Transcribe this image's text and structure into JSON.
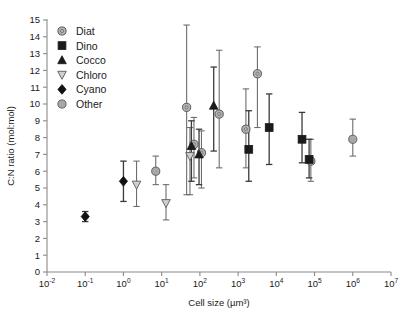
{
  "chart_data": {
    "type": "scatter",
    "title": "",
    "xlabel": "Cell size (µm³)",
    "ylabel": "C:N ratio (mol:mol)",
    "xscale": "log",
    "xlim": [
      0.01,
      10000000
    ],
    "ylim": [
      0,
      15
    ],
    "yticks": [
      0,
      1,
      2,
      3,
      4,
      5,
      6,
      7,
      8,
      9,
      10,
      11,
      12,
      13,
      14,
      15
    ],
    "xtick_labels": [
      "10-2",
      "10-1",
      "100",
      "101",
      "102",
      "103",
      "104",
      "105",
      "106",
      "107"
    ],
    "xtick_mantissa": "10",
    "xtick_exponents": [
      "-2",
      "-1",
      "0",
      "1",
      "2",
      "3",
      "4",
      "5",
      "6",
      "7"
    ],
    "grid": false,
    "legend_position": "top-left",
    "legend": [
      {
        "name": "Diat",
        "marker": "circle-ring",
        "color": "#b3b3b3",
        "edge": "#4d4d4d"
      },
      {
        "name": "Dino",
        "marker": "square",
        "color": "#1a1a1a",
        "edge": "#1a1a1a"
      },
      {
        "name": "Cocco",
        "marker": "triangle-up",
        "color": "#1a1a1a",
        "edge": "#1a1a1a"
      },
      {
        "name": "Chloro",
        "marker": "triangle-down",
        "color": "#cfcfcf",
        "edge": "#5a5a5a"
      },
      {
        "name": "Cyano",
        "marker": "diamond",
        "color": "#111111",
        "edge": "#111111"
      },
      {
        "name": "Other",
        "marker": "circle",
        "color": "#a8a8a8",
        "edge": "#5a5a5a"
      }
    ],
    "series": [
      {
        "name": "Cyano",
        "marker": "diamond",
        "points": [
          {
            "x": 0.1,
            "y": 3.3,
            "ylow": 3.0,
            "yhigh": 3.6
          },
          {
            "x": 1.0,
            "y": 5.4,
            "ylow": 4.2,
            "yhigh": 6.6
          }
        ]
      },
      {
        "name": "Chloro",
        "marker": "triangle-down",
        "points": [
          {
            "x": 2.2,
            "y": 5.2,
            "ylow": 3.9,
            "yhigh": 6.6
          },
          {
            "x": 13.0,
            "y": 4.1,
            "ylow": 3.1,
            "yhigh": 5.2
          },
          {
            "x": 55.0,
            "y": 6.9,
            "ylow": 4.6,
            "yhigh": 8.6
          }
        ]
      },
      {
        "name": "Other",
        "marker": "circle",
        "points": [
          {
            "x": 7.0,
            "y": 6.0,
            "ylow": 5.2,
            "yhigh": 6.9
          },
          {
            "x": 1000000.0,
            "y": 7.9,
            "ylow": 6.9,
            "yhigh": 9.1
          }
        ]
      },
      {
        "name": "Diat",
        "marker": "circle-ring",
        "points": [
          {
            "x": 45.0,
            "y": 9.8,
            "ylow": 4.6,
            "yhigh": 14.7
          },
          {
            "x": 70.0,
            "y": 7.6,
            "ylow": 5.6,
            "yhigh": 9.2
          },
          {
            "x": 110.0,
            "y": 7.1,
            "ylow": 5.0,
            "yhigh": 8.4
          },
          {
            "x": 320.0,
            "y": 9.4,
            "ylow": 6.2,
            "yhigh": 13.2
          },
          {
            "x": 1600.0,
            "y": 8.5,
            "ylow": 6.2,
            "yhigh": 10.9
          },
          {
            "x": 3200.0,
            "y": 11.8,
            "ylow": 8.6,
            "yhigh": 13.4
          },
          {
            "x": 80000.0,
            "y": 6.6,
            "ylow": 5.4,
            "yhigh": 7.9
          }
        ]
      },
      {
        "name": "Cocco",
        "marker": "triangle-up",
        "points": [
          {
            "x": 60.0,
            "y": 7.5,
            "ylow": 5.4,
            "yhigh": 9.0
          },
          {
            "x": 95.0,
            "y": 7.0,
            "ylow": 5.2,
            "yhigh": 8.5
          },
          {
            "x": 230.0,
            "y": 9.9,
            "ylow": 7.2,
            "yhigh": 12.2
          }
        ]
      },
      {
        "name": "Dino",
        "marker": "square",
        "points": [
          {
            "x": 1900.0,
            "y": 7.3,
            "ylow": 5.4,
            "yhigh": 9.6
          },
          {
            "x": 6500.0,
            "y": 8.6,
            "ylow": 6.4,
            "yhigh": 10.6
          },
          {
            "x": 47000.0,
            "y": 7.9,
            "ylow": 6.5,
            "yhigh": 9.5
          },
          {
            "x": 72000.0,
            "y": 6.7,
            "ylow": 5.6,
            "yhigh": 7.9
          }
        ]
      }
    ]
  }
}
